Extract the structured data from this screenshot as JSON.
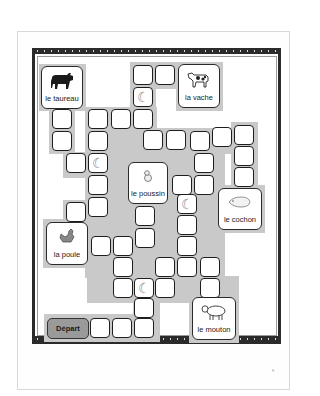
{
  "board": {
    "title": "",
    "start_label": "Départ",
    "page_number": "9",
    "colors": {
      "path_gray": "#c9c9c9",
      "square_border": "#1e1e1e",
      "frame": "#2a2a2a",
      "start_fill": "#9a9a9a"
    }
  },
  "cards": {
    "taureau": {
      "label": "le taureau",
      "icon": "bull-icon"
    },
    "vache": {
      "label": "la vache",
      "icon": "cow-icon"
    },
    "poussin": {
      "label": "le poussin",
      "icon": "chick-icon"
    },
    "cochon": {
      "label": "le cochon",
      "icon": "pig-icon"
    },
    "poule": {
      "label": "la poule",
      "icon": "hen-icon"
    },
    "mouton": {
      "label": "le mouton",
      "icon": "sheep-icon"
    }
  },
  "moon_glyph": "☾"
}
